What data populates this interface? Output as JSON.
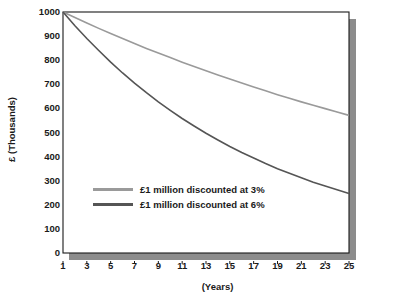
{
  "chart_data": {
    "type": "line",
    "title": "",
    "xlabel": "(Years)",
    "ylabel": "£ (Thousands)",
    "xlim": [
      1,
      25
    ],
    "ylim": [
      0,
      1000
    ],
    "grid": false,
    "legend_position": "inside-lower-left",
    "x": [
      1,
      2,
      3,
      4,
      5,
      6,
      7,
      8,
      9,
      10,
      11,
      12,
      13,
      14,
      15,
      16,
      17,
      18,
      19,
      20,
      21,
      22,
      23,
      24,
      25
    ],
    "xticks": [
      "1",
      "3",
      "5",
      "7",
      "9",
      "11",
      "13",
      "15",
      "17",
      "19",
      "21",
      "23",
      "25"
    ],
    "xtick_values": [
      1,
      3,
      5,
      7,
      9,
      11,
      13,
      15,
      17,
      19,
      21,
      23,
      25
    ],
    "yticks": [
      "0",
      "100",
      "200",
      "300",
      "400",
      "500",
      "600",
      "700",
      "800",
      "900",
      "1000"
    ],
    "ytick_values": [
      0,
      100,
      200,
      300,
      400,
      500,
      600,
      700,
      800,
      900,
      1000
    ],
    "series": [
      {
        "name": "£1 million discounted at 3%",
        "color": "#9a9a9a",
        "values": [
          1000,
          977,
          954,
          932,
          911,
          890,
          869,
          849,
          830,
          811,
          792,
          774,
          756,
          739,
          722,
          705,
          689,
          673,
          657,
          642,
          627,
          613,
          599,
          585,
          571
        ]
      },
      {
        "name": "£1 million discounted at 6%",
        "color": "#555555",
        "values": [
          1000,
          943,
          890,
          840,
          792,
          747,
          705,
          665,
          627,
          592,
          558,
          527,
          497,
          469,
          442,
          417,
          394,
          371,
          350,
          331,
          312,
          294,
          278,
          262,
          247
        ]
      }
    ],
    "endpoint_labels": {
      "rate_3_year_25": 450,
      "rate_6_year_25": 210
    },
    "colors": {
      "axis": "#1a1a1a",
      "shadow": "#8c8c8c",
      "background": "#ffffff",
      "text": "#1a1a1a"
    }
  },
  "legend": {
    "items": [
      {
        "label": "£1 million discounted at 3%",
        "color": "#9a9a9a"
      },
      {
        "label": "£1 million discounted at 6%",
        "color": "#555555"
      }
    ]
  }
}
